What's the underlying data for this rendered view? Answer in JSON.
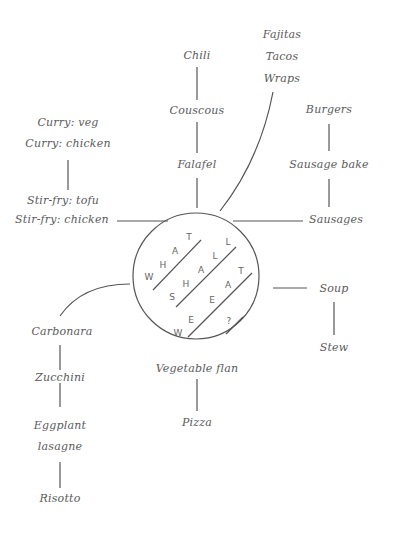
{
  "diagram": {
    "center": {
      "letters": [
        {
          "ch": "T",
          "x": 189,
          "y": 237
        },
        {
          "ch": "A",
          "x": 175,
          "y": 251
        },
        {
          "ch": "H",
          "x": 163,
          "y": 265
        },
        {
          "ch": "W",
          "x": 149,
          "y": 277
        },
        {
          "ch": "L",
          "x": 228,
          "y": 242
        },
        {
          "ch": "L",
          "x": 215,
          "y": 256
        },
        {
          "ch": "A",
          "x": 201,
          "y": 270
        },
        {
          "ch": "H",
          "x": 186,
          "y": 284
        },
        {
          "ch": "S",
          "x": 172,
          "y": 297
        },
        {
          "ch": "T",
          "x": 241,
          "y": 271
        },
        {
          "ch": "A",
          "x": 228,
          "y": 285
        },
        {
          "ch": "E",
          "x": 212,
          "y": 300
        },
        {
          "ch": "E",
          "x": 191,
          "y": 320
        },
        {
          "ch": "W",
          "x": 178,
          "y": 333
        },
        {
          "ch": "?",
          "x": 229,
          "y": 321
        }
      ],
      "phrase": "WHAT SHALL WE EAT ?"
    },
    "branches": {
      "top_center": [
        "Chili",
        "Couscous",
        "Falafel"
      ],
      "top_right": [
        "Fajitas",
        "Tacos",
        "Wraps"
      ],
      "left": [
        "Curry: veg",
        "Curry: chicken",
        "Stir-fry: tofu",
        "Stir-fry: chicken"
      ],
      "right": [
        "Burgers",
        "Sausage bake",
        "Sausages"
      ],
      "right_lower": [
        "Soup",
        "Stew"
      ],
      "bottom": [
        "Vegetable flan",
        "Pizza"
      ],
      "bottom_left": [
        "Carbonara",
        "Zucchini",
        "Eggplant",
        "lasagne",
        "Risotto"
      ]
    }
  }
}
